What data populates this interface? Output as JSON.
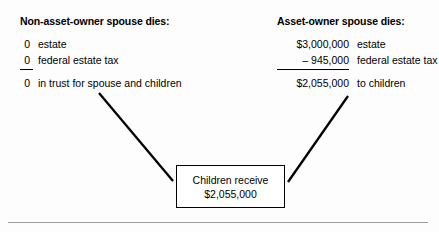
{
  "figure": {
    "background_color": "#fdfdfd",
    "line_color": "#000000",
    "rule_color": "#9a9a9a"
  },
  "left_panel": {
    "heading": "Non-asset-owner spouse dies:",
    "rows": [
      {
        "amount": "0",
        "label": "estate"
      },
      {
        "amount": "0",
        "label": "federal estate tax"
      },
      {
        "amount": "0",
        "label": "in trust for spouse and children"
      }
    ]
  },
  "right_panel": {
    "heading": "Asset-owner spouse dies:",
    "rows": [
      {
        "amount": "$3,000,000",
        "label": "estate"
      },
      {
        "amount": "–  945,000",
        "label": "federal estate tax"
      },
      {
        "amount": "$2,055,000",
        "label": "to children"
      }
    ]
  },
  "result_box": {
    "line1": "Children receive",
    "line2": "$2,055,000"
  }
}
